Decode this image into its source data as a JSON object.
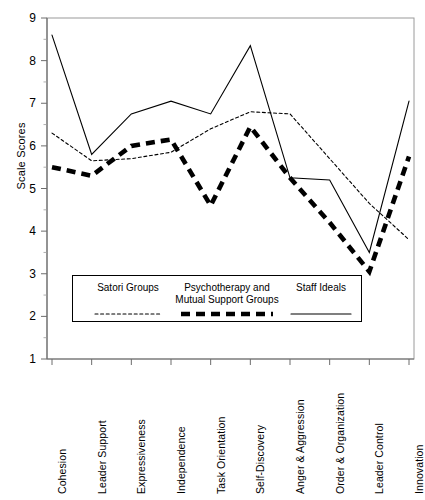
{
  "chart_data": {
    "type": "line",
    "title": "",
    "xlabel": "",
    "ylabel": "Scale Scores",
    "ylim": [
      1,
      9
    ],
    "yticks": [
      9,
      8,
      7,
      6,
      5,
      4,
      3,
      2,
      1
    ],
    "grid": false,
    "legend_position": "inside-bottom",
    "categories": [
      "Cohesion",
      "Leader Support",
      "Expressiveness",
      "Independence",
      "Task Orientation",
      "Self-Discovery",
      "Anger & Aggression",
      "Order & Organization",
      "Leader Control",
      "Innovation"
    ],
    "series": [
      {
        "name": "Satori Groups",
        "style": "dotted",
        "color": "#000000",
        "values": [
          6.3,
          5.65,
          5.7,
          5.85,
          6.4,
          6.8,
          6.75,
          5.7,
          4.65,
          3.8
        ]
      },
      {
        "name": "Psychotherapy and Mutual Support Groups",
        "style": "thick-dashed",
        "color": "#000000",
        "values": [
          5.5,
          5.3,
          6.0,
          6.15,
          4.6,
          6.45,
          5.25,
          4.2,
          3.05,
          5.75
        ]
      },
      {
        "name": "Staff Ideals",
        "style": "solid",
        "color": "#000000",
        "values": [
          8.6,
          5.8,
          6.75,
          7.05,
          6.75,
          8.35,
          5.25,
          5.2,
          3.5,
          7.05
        ]
      }
    ]
  },
  "axis": {
    "y_title": "Scale Scores",
    "y_tick_labels": [
      "9",
      "8",
      "7",
      "6",
      "5",
      "4",
      "3",
      "2",
      "1"
    ],
    "x_tick_labels": [
      "Cohesion",
      "Leader Support",
      "Expressiveness",
      "Independence",
      "Task Orientation",
      "Self-Discovery",
      "Anger & Aggression",
      "Order & Organization",
      "Leader Control",
      "Innovation"
    ]
  },
  "legend": {
    "entries": [
      {
        "label_line1": "Satori Groups",
        "label_line2": "",
        "style": "dotted"
      },
      {
        "label_line1": "Psychotherapy and",
        "label_line2": "Mutual Support Groups",
        "style": "thick-dashed"
      },
      {
        "label_line1": "Staff Ideals",
        "label_line2": "",
        "style": "solid"
      }
    ]
  },
  "header": {
    "cropped_caption": ""
  }
}
